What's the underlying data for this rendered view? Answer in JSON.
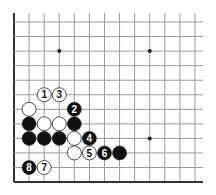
{
  "diagram": {
    "type": "go-board-diagram",
    "board": {
      "origin_x": 14,
      "origin_y": 22,
      "spacing_x": 15.08,
      "spacing_y": 14.55,
      "columns": 13,
      "rows": 12,
      "line_top": 13,
      "line_right": 203,
      "left_edge": true,
      "bottom_edge": true,
      "line_color": "#9a9a9a",
      "edge_color": "#333333"
    },
    "star_points": [
      {
        "col": 3,
        "row": 2
      },
      {
        "col": 9,
        "row": 2
      },
      {
        "col": 9,
        "row": 8
      }
    ],
    "stones": [
      {
        "color": "white",
        "col": 2,
        "row": 5,
        "label": "1"
      },
      {
        "color": "white",
        "col": 3,
        "row": 5,
        "label": "3"
      },
      {
        "color": "white",
        "col": 1,
        "row": 6,
        "label": ""
      },
      {
        "color": "black",
        "col": 4,
        "row": 6,
        "label": "2"
      },
      {
        "color": "black",
        "col": 1,
        "row": 7,
        "label": ""
      },
      {
        "color": "white",
        "col": 2,
        "row": 7,
        "label": ""
      },
      {
        "color": "white",
        "col": 3,
        "row": 7,
        "label": ""
      },
      {
        "color": "black",
        "col": 4,
        "row": 7,
        "label": ""
      },
      {
        "color": "black",
        "col": 1,
        "row": 8,
        "label": ""
      },
      {
        "color": "black",
        "col": 2,
        "row": 8,
        "label": ""
      },
      {
        "color": "black",
        "col": 3,
        "row": 8,
        "label": ""
      },
      {
        "color": "white",
        "col": 4,
        "row": 8,
        "label": ""
      },
      {
        "color": "black",
        "col": 5,
        "row": 8,
        "label": "4"
      },
      {
        "color": "white",
        "col": 4,
        "row": 9,
        "label": ""
      },
      {
        "color": "white",
        "col": 5,
        "row": 9,
        "label": "5"
      },
      {
        "color": "black",
        "col": 6,
        "row": 9,
        "label": "6"
      },
      {
        "color": "black",
        "col": 7,
        "row": 9,
        "label": ""
      },
      {
        "color": "black",
        "col": 1,
        "row": 10,
        "label": "8"
      },
      {
        "color": "white",
        "col": 2,
        "row": 10,
        "label": "7"
      }
    ]
  }
}
